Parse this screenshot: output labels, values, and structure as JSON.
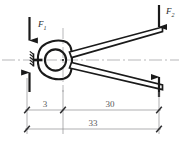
{
  "diagram": {
    "type": "engineering-line-drawing",
    "background_color": "#ffffff",
    "line_color": "#1a1a1a",
    "dimension_color": "#6e6e70",
    "centerline_color": "#9a9a9c"
  },
  "forces": [
    {
      "id": "F1",
      "label_letter": "F",
      "label_subscript": "1",
      "position": "jaw-top",
      "direction": "down",
      "label_x": 38,
      "label_y": 27
    },
    {
      "id": "F2",
      "label_letter": "F",
      "label_subscript": "2",
      "position": "handle-top-right",
      "direction": "down",
      "label_x": 167,
      "label_y": 14
    }
  ],
  "dimensions": [
    {
      "id": "dim-3",
      "value": "3",
      "text_x": 45,
      "text_y": 107,
      "line_y": 110,
      "from_x": 27,
      "to_x": 63
    },
    {
      "id": "dim-30",
      "value": "30",
      "text_x": 107,
      "text_y": 107,
      "line_y": 110,
      "from_x": 63,
      "to_x": 159
    },
    {
      "id": "dim-33",
      "value": "33",
      "text_x": 93,
      "text_y": 126,
      "line_y": 129,
      "from_x": 27,
      "to_x": 159
    }
  ],
  "components": [
    {
      "id": "jaw-ring",
      "name": "outer-jaw-ring"
    },
    {
      "id": "workpiece",
      "name": "gripped-round-workpiece"
    },
    {
      "id": "upper-handle",
      "name": "upper-handle-arm"
    },
    {
      "id": "lower-handle",
      "name": "lower-handle-arm"
    },
    {
      "id": "fixed-support",
      "name": "left-fixed-support"
    },
    {
      "id": "pivot",
      "name": "pivot-point"
    }
  ]
}
